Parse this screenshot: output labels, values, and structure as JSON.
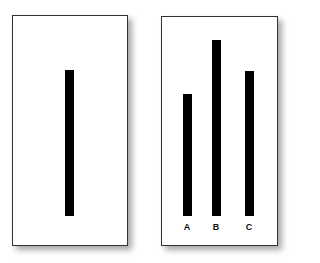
{
  "left_card": {
    "reference_line": {
      "top": 70,
      "bottom": 216,
      "x": 65,
      "width": 9
    }
  },
  "right_card": {
    "lines": [
      {
        "label": "A",
        "top": 94,
        "bottom": 216,
        "x": 183,
        "width": 9
      },
      {
        "label": "B",
        "top": 40,
        "bottom": 216,
        "x": 212,
        "width": 9
      },
      {
        "label": "C",
        "top": 71,
        "bottom": 216,
        "x": 245,
        "width": 9
      }
    ]
  }
}
